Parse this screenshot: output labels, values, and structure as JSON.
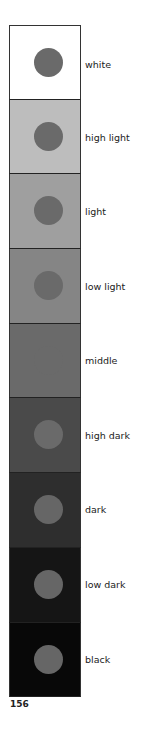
{
  "swatches": [
    {
      "label": "white",
      "bg": "#ffffff",
      "dot": "#6a6a6a"
    },
    {
      "label": "high light",
      "bg": "#bdbdbd",
      "dot": "#6a6a6a"
    },
    {
      "label": "light",
      "bg": "#9f9f9f",
      "dot": "#6a6a6a"
    },
    {
      "label": "low light",
      "bg": "#858585",
      "dot": "#6a6a6a"
    },
    {
      "label": "middle",
      "bg": "#6a6a6a",
      "dot": "#6a6a6a"
    },
    {
      "label": "high dark",
      "bg": "#4a4a4a",
      "dot": "#6a6a6a"
    },
    {
      "label": "dark",
      "bg": "#2e2e2e",
      "dot": "#666666"
    },
    {
      "label": "low dark",
      "bg": "#151515",
      "dot": "#666666"
    },
    {
      "label": "black",
      "bg": "#080808",
      "dot": "#666666"
    }
  ],
  "page_number": "156"
}
